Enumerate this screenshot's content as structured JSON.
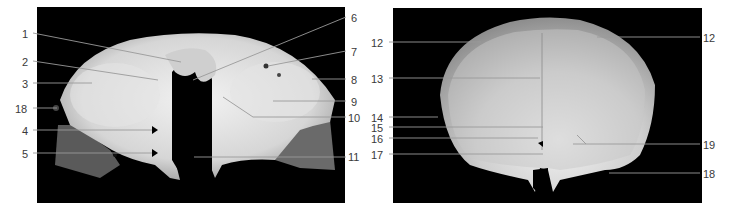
{
  "figure": {
    "left_view": {
      "labels": [
        {
          "num": "1",
          "x": 22,
          "y": 28
        },
        {
          "num": "2",
          "x": 22,
          "y": 56
        },
        {
          "num": "3",
          "x": 22,
          "y": 78
        },
        {
          "num": "18",
          "x": 15,
          "y": 103
        },
        {
          "num": "4",
          "x": 22,
          "y": 125
        },
        {
          "num": "5",
          "x": 22,
          "y": 148
        },
        {
          "num": "6",
          "x": 351,
          "y": 12
        },
        {
          "num": "7",
          "x": 351,
          "y": 46
        },
        {
          "num": "8",
          "x": 351,
          "y": 74
        },
        {
          "num": "9",
          "x": 351,
          "y": 96
        },
        {
          "num": "10",
          "x": 348,
          "y": 112
        },
        {
          "num": "11",
          "x": 348,
          "y": 151
        }
      ]
    },
    "right_view": {
      "labels": [
        {
          "num": "12",
          "x": 371,
          "y": 37
        },
        {
          "num": "13",
          "x": 371,
          "y": 73
        },
        {
          "num": "14",
          "x": 371,
          "y": 112
        },
        {
          "num": "15",
          "x": 371,
          "y": 122
        },
        {
          "num": "16",
          "x": 371,
          "y": 133
        },
        {
          "num": "17",
          "x": 371,
          "y": 149
        },
        {
          "num": "12",
          "x": 703,
          "y": 32
        },
        {
          "num": "19",
          "x": 703,
          "y": 139
        },
        {
          "num": "18",
          "x": 703,
          "y": 168
        }
      ]
    },
    "colors": {
      "background": "#ffffff",
      "panel": "#000000",
      "bone_light": "#e8e8e8",
      "bone_mid": "#bdbdbd",
      "bone_dark": "#7a7a7a",
      "leader_line": "#9a9a9a",
      "label_text": "#3a3a3a"
    }
  }
}
